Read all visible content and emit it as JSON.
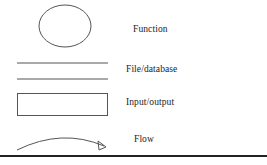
{
  "diagram": {
    "background_color": "#ffffff",
    "stroke_color": "#555555",
    "text_color": "#1b1b1b",
    "rule_color": "#222222",
    "rows": [
      {
        "id": "function",
        "label": "Function",
        "shape": "ellipse",
        "shape_bounds": {
          "x": 39,
          "y": 5,
          "width": 52,
          "height": 42
        }
      },
      {
        "id": "file-database",
        "label": "File/database",
        "shape": "two-horizontal-lines",
        "shape_bounds": {
          "x": 17,
          "y": 62,
          "width": 91,
          "height": 18
        }
      },
      {
        "id": "input-output",
        "label": "Input/output",
        "shape": "rectangle",
        "shape_bounds": {
          "x": 17,
          "y": 93,
          "width": 91,
          "height": 23
        }
      },
      {
        "id": "flow",
        "label": "Flow",
        "shape": "curved-arrow",
        "shape_bounds": {
          "x": 17,
          "y": 132,
          "width": 91,
          "height": 18
        }
      }
    ],
    "bottom_rule": {
      "x": 0,
      "y": 155,
      "width": 267,
      "height": 2
    }
  }
}
